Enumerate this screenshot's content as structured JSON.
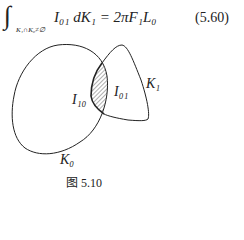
{
  "equation": {
    "integral_sign": "∫",
    "subscript": "K₁∩K₀≠∅",
    "body": "I₀₁ dK₁ = 2πF₁L₀",
    "number": "(5.60)"
  },
  "figure": {
    "labels": {
      "k0": "K₀",
      "k1": "K₁",
      "i10": "I₁₀",
      "i01": "I₀₁"
    },
    "caption": "图 5.10"
  }
}
